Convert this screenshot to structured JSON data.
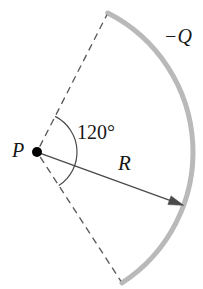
{
  "figure": {
    "type": "physics-diagram",
    "canvas": {
      "width": 203,
      "height": 289,
      "background": "#ffffff"
    },
    "labels": {
      "point_label": "P",
      "angle_label": "120°",
      "radius_label": "R",
      "charge_label": "−Q"
    },
    "colors": {
      "arc_stroke": "#b9b9b9",
      "line_stroke": "#4a4a4a",
      "dash_stroke": "#5a5a5a",
      "text": "#171717",
      "point_fill": "#000000"
    },
    "geometry": {
      "center_x": 37,
      "center_y": 152,
      "radius": 156,
      "arc_span_degrees": 120,
      "arc_start_angle_degrees": 63,
      "arc_end_angle_degrees": -57,
      "radius_arrow_angle_degrees": -20,
      "point_dot_radius": 5,
      "angle_marker_radius": 40,
      "arc_stroke_width": 5,
      "line_stroke_width": 1.3,
      "dash_pattern": "7 5"
    }
  }
}
